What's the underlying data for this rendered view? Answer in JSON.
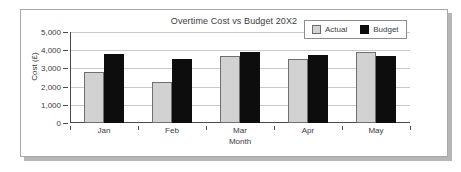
{
  "chart_data": {
    "type": "bar",
    "title": "Overtime Cost vs Budget 20X2",
    "xlabel": "Month",
    "ylabel": "Cost (£)",
    "categories": [
      "Jan",
      "Feb",
      "Mar",
      "Apr",
      "May"
    ],
    "series": [
      {
        "name": "Actual",
        "values": [
          2800,
          2250,
          3700,
          3500,
          3900
        ],
        "color": "#d2d2d2"
      },
      {
        "name": "Budget",
        "values": [
          3800,
          3500,
          3900,
          3750,
          3700
        ],
        "color": "#0d0d0d"
      }
    ],
    "ylim": [
      0,
      5000
    ],
    "yticks": [
      0,
      1000,
      2000,
      3000,
      4000,
      5000
    ],
    "ytick_labels": [
      "0",
      "1,000",
      "2,000",
      "3,000",
      "4,000",
      "5,000"
    ],
    "grid": true,
    "legend_position": "top-right"
  },
  "legend": {
    "items": [
      {
        "label": "Actual",
        "swatch": "legend-swatch-actual-icon"
      },
      {
        "label": "Budget",
        "swatch": "legend-swatch-budget-icon"
      }
    ]
  }
}
